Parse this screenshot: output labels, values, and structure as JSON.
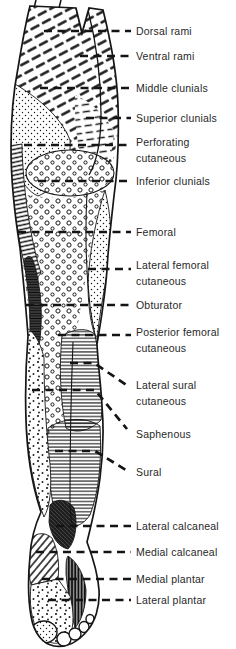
{
  "diagram": {
    "type": "anatomical-figure",
    "colors": {
      "ink": "#161616",
      "paper": "#ffffff"
    },
    "labels": [
      {
        "id": "dorsal-rami",
        "text": "Dorsal rami"
      },
      {
        "id": "ventral-rami",
        "text": "Ventral rami"
      },
      {
        "id": "middle-clunials",
        "text": "Middle clunials"
      },
      {
        "id": "superior-clunials",
        "text": "Superior clunials"
      },
      {
        "id": "perforating-cutaneous",
        "text": "Perforating cutaneous"
      },
      {
        "id": "inferior-clunials",
        "text": "Inferior clunials"
      },
      {
        "id": "femoral",
        "text": "Femoral"
      },
      {
        "id": "lateral-femoral-cutaneous",
        "text": "Lateral femoral cutaneous"
      },
      {
        "id": "obturator",
        "text": "Obturator"
      },
      {
        "id": "posterior-femoral-cutaneous",
        "text": "Posterior femoral cutaneous"
      },
      {
        "id": "lateral-sural-cutaneous",
        "text": "Lateral sural cutaneous"
      },
      {
        "id": "saphenous",
        "text": "Saphenous"
      },
      {
        "id": "sural",
        "text": "Sural"
      },
      {
        "id": "lateral-calcaneal",
        "text": "Lateral calcaneal"
      },
      {
        "id": "medial-calcaneal",
        "text": "Medial calcaneal"
      },
      {
        "id": "medial-plantar",
        "text": "Medial plantar"
      },
      {
        "id": "lateral-plantar",
        "text": "Lateral plantar"
      }
    ],
    "regions": [
      {
        "id": "dorsal-rami",
        "texture": "bold diagonal dashes"
      },
      {
        "id": "middle-clunials",
        "texture": "fine stipple"
      },
      {
        "id": "superior-clunials",
        "texture": "short horizontal dashes"
      },
      {
        "id": "inferior-clunials",
        "texture": "open circles in ellipse"
      },
      {
        "id": "femoral",
        "texture": "ladder hatch band"
      },
      {
        "id": "lateral-femoral-cutaneous",
        "texture": "fine stipple strip"
      },
      {
        "id": "obturator",
        "texture": "dark horizontal-lined lens"
      },
      {
        "id": "posterior-femoral-cutaneous",
        "texture": "open circles column"
      },
      {
        "id": "lateral-sural-cutaneous",
        "texture": "horizontal lines"
      },
      {
        "id": "saphenous",
        "texture": "coarse stipple column"
      },
      {
        "id": "sural",
        "texture": "horizontal lines"
      },
      {
        "id": "lateral-calcaneal",
        "texture": "dark crosshatch"
      },
      {
        "id": "medial-calcaneal",
        "texture": "diagonal hatch"
      },
      {
        "id": "medial-plantar",
        "texture": "coarse stipple"
      },
      {
        "id": "lateral-plantar",
        "texture": "dark vertical hatch"
      }
    ]
  }
}
